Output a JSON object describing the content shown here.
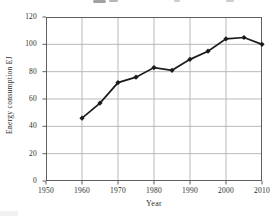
{
  "chart_data": {
    "type": "line",
    "title": "",
    "xlabel": "Year",
    "ylabel": "Energy consumption EJ",
    "series_name": "Energy consumption (EJ)",
    "x": [
      1960,
      1965,
      1970,
      1975,
      1980,
      1985,
      1990,
      1995,
      2000,
      2005,
      2010
    ],
    "values": [
      46,
      57,
      72,
      76,
      83,
      81,
      89,
      95,
      104,
      105,
      100
    ],
    "xlim": [
      1950,
      2010
    ],
    "ylim": [
      0,
      120
    ],
    "x_ticks": [
      1950,
      1960,
      1970,
      1980,
      1990,
      2000,
      2010
    ],
    "y_ticks": [
      0,
      20,
      40,
      60,
      80,
      100,
      120
    ],
    "grid": true,
    "legend": "none",
    "marker": "diamond",
    "colors": {
      "line": "#1c1c1c",
      "grid": "#b9b9b9",
      "frame": "#5f5f5f",
      "text": "#2e2e2e",
      "background": "#ffffff"
    }
  }
}
